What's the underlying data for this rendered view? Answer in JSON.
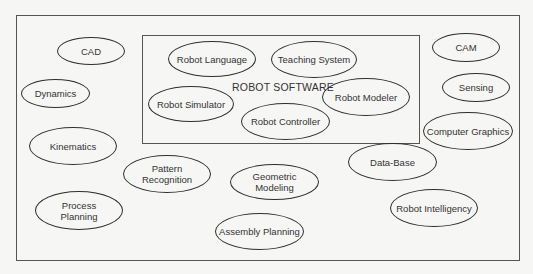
{
  "diagram": {
    "inner_box_label": "ROBOT SOFTWARE",
    "inner_nodes": [
      {
        "id": "robot-language",
        "label": "Robot Language",
        "x": 168,
        "y": 41,
        "w": 88,
        "h": 36
      },
      {
        "id": "teaching-system",
        "label": "Teaching System",
        "x": 271,
        "y": 41,
        "w": 86,
        "h": 37
      },
      {
        "id": "robot-simulator",
        "label": "Robot Simulator",
        "x": 148,
        "y": 86,
        "w": 86,
        "h": 36
      },
      {
        "id": "robot-controller",
        "label": "Robot Controller",
        "x": 241,
        "y": 103,
        "w": 89,
        "h": 37
      },
      {
        "id": "robot-modeler",
        "label": "Robot Modeler",
        "x": 322,
        "y": 78,
        "w": 88,
        "h": 38
      }
    ],
    "outer_nodes": [
      {
        "id": "cad",
        "label": "CAD",
        "x": 57,
        "y": 37,
        "w": 68,
        "h": 28
      },
      {
        "id": "dynamics",
        "label": "Dynamics",
        "x": 21,
        "y": 79,
        "w": 69,
        "h": 29
      },
      {
        "id": "kinematics",
        "label": "Kinematics",
        "x": 29,
        "y": 127,
        "w": 88,
        "h": 38
      },
      {
        "id": "pattern-recognition",
        "label": "Pattern\nRecognition",
        "x": 123,
        "y": 155,
        "w": 88,
        "h": 38
      },
      {
        "id": "geometric-modeling",
        "label": "Geometric\nModeling",
        "x": 230,
        "y": 164,
        "w": 89,
        "h": 36
      },
      {
        "id": "process-planning",
        "label": "Process\nPlanning",
        "x": 35,
        "y": 191,
        "w": 88,
        "h": 39
      },
      {
        "id": "assembly-planning",
        "label": "Assembly Planning",
        "x": 215,
        "y": 213,
        "w": 89,
        "h": 37
      },
      {
        "id": "cam",
        "label": "CAM",
        "x": 432,
        "y": 33,
        "w": 68,
        "h": 29
      },
      {
        "id": "sensing",
        "label": "Sensing",
        "x": 442,
        "y": 73,
        "w": 68,
        "h": 29
      },
      {
        "id": "computer-graphics",
        "label": "Computer Graphics",
        "x": 423,
        "y": 112,
        "w": 90,
        "h": 38
      },
      {
        "id": "data-base",
        "label": "Data-Base",
        "x": 348,
        "y": 143,
        "w": 89,
        "h": 38
      },
      {
        "id": "robot-intelligency",
        "label": "Robot Intelligency",
        "x": 390,
        "y": 189,
        "w": 88,
        "h": 38
      }
    ]
  }
}
